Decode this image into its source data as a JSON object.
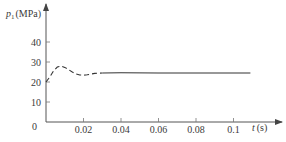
{
  "chart_data": {
    "type": "line",
    "title": "",
    "xlabel": "t (s)",
    "ylabel": "p1 (MPa)",
    "xlabel_var": "t",
    "xlabel_unit": "(s)",
    "ylabel_var": "p",
    "ylabel_sub": "1",
    "ylabel_unit": "(MPa)",
    "xlim": [
      0,
      0.115
    ],
    "ylim": [
      0,
      45
    ],
    "x_ticks": [
      0.02,
      0.04,
      0.06,
      0.08,
      0.1
    ],
    "x_tick_labels": [
      "0.02",
      "0.04",
      "0.06",
      "0.08",
      "0.1"
    ],
    "y_ticks": [
      0,
      10,
      20,
      30,
      40
    ],
    "y_tick_labels": [
      "0",
      "10",
      "20",
      "30",
      "40"
    ],
    "grid": false,
    "legend": null,
    "series": [
      {
        "name": "p1 transient (dashed)",
        "style": "dashed",
        "x": [
          0,
          0.002,
          0.004,
          0.006,
          0.008,
          0.01,
          0.012,
          0.014,
          0.016,
          0.018,
          0.02,
          0.022,
          0.024,
          0.026,
          0.028,
          0.03
        ],
        "y": [
          20,
          22.5,
          25.5,
          27.5,
          28,
          27.3,
          26.2,
          25,
          24,
          23.5,
          23.4,
          23.6,
          24,
          24.3,
          24.4,
          24.5
        ]
      },
      {
        "name": "p1 steady state (solid)",
        "style": "solid",
        "x": [
          0.03,
          0.04,
          0.06,
          0.08,
          0.1,
          0.109
        ],
        "y": [
          24.5,
          24.6,
          24.5,
          24.5,
          24.5,
          24.5
        ]
      }
    ]
  }
}
